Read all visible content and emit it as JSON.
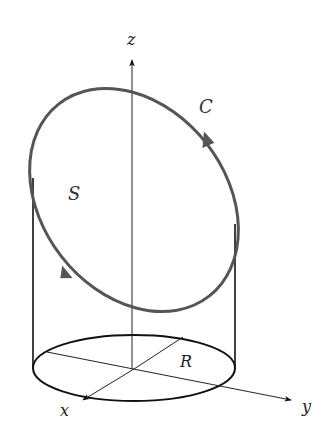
{
  "diagram": {
    "labels": {
      "z_axis": "z",
      "x_axis": "x",
      "y_axis": "y",
      "radius": "R",
      "curve": "C",
      "surface": "S"
    },
    "colors": {
      "curve": "#555555",
      "axes": "#222222",
      "cylinder": "#111111",
      "background": "#ffffff"
    },
    "elements": [
      {
        "name": "z-axis",
        "type": "arrow",
        "direction": "up"
      },
      {
        "name": "x-axis",
        "type": "arrow",
        "direction": "toward viewer (lower-left)"
      },
      {
        "name": "y-axis",
        "type": "arrow",
        "direction": "right"
      },
      {
        "name": "base-circle",
        "type": "ellipse",
        "label": "R"
      },
      {
        "name": "cylinder-sides",
        "type": "lines"
      },
      {
        "name": "curve-C",
        "type": "closed tilted ellipse",
        "orientation": "counterclockwise viewed from above"
      }
    ]
  }
}
